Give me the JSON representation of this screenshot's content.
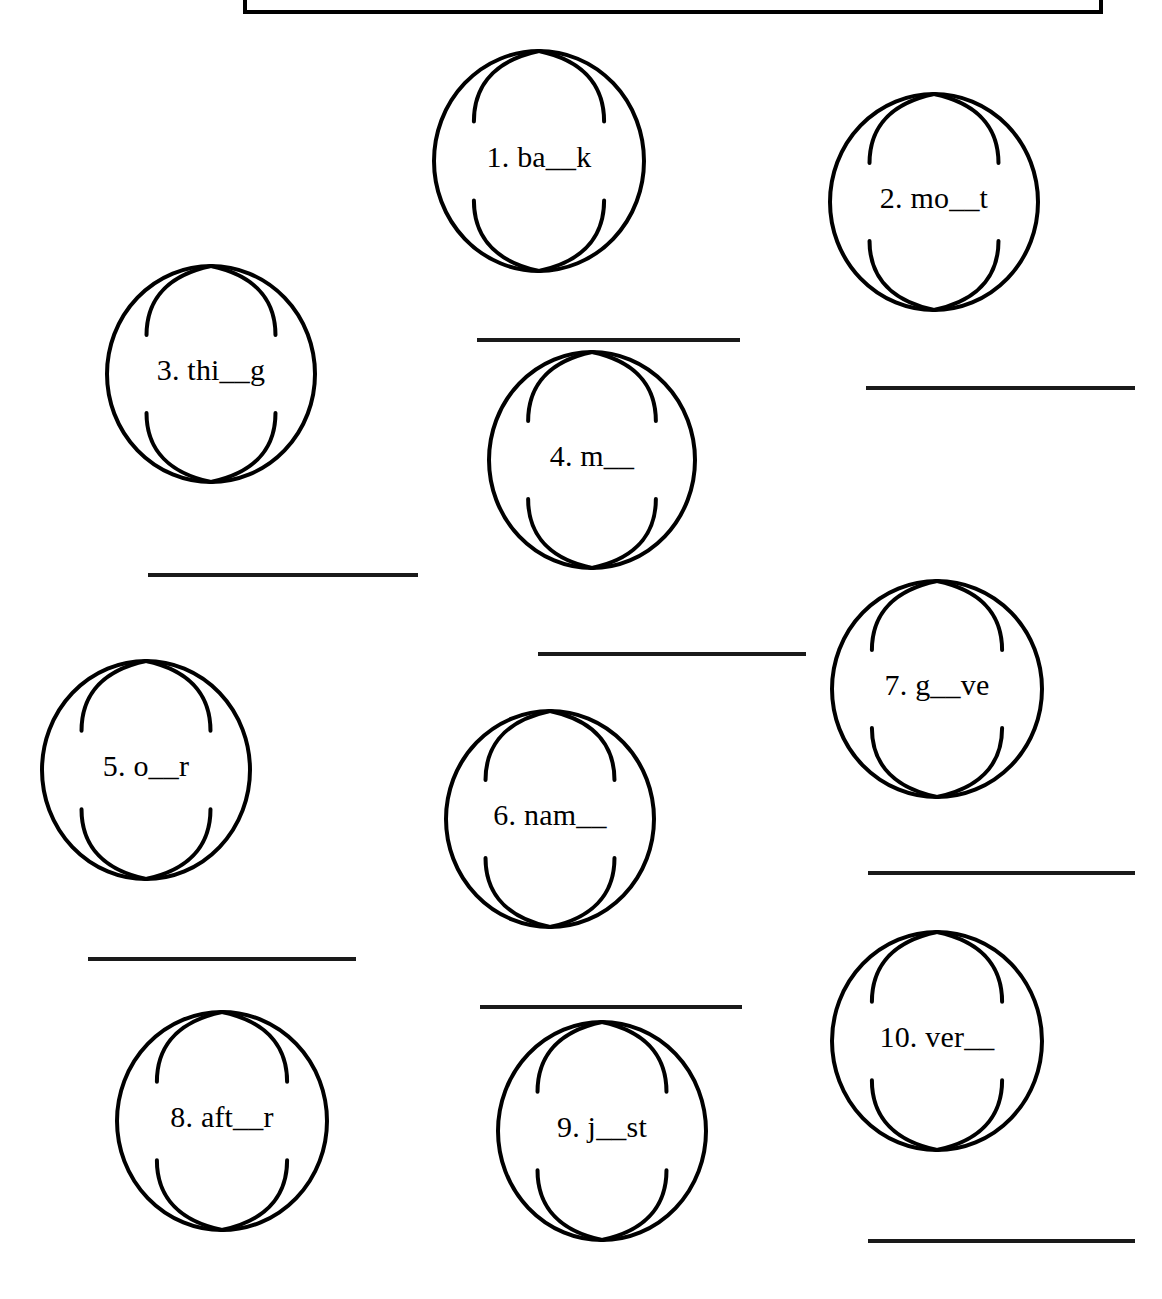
{
  "page": {
    "kind": "worksheet",
    "width": 1162,
    "height": 1299,
    "background_color": "#ffffff",
    "ink_color": "#000000",
    "title_box": {
      "text": "",
      "border_color": "#000000",
      "visible_portion": "bottom-border-only"
    }
  },
  "items": [
    {
      "number": "1.",
      "label": "1. ba__k",
      "word_fragment": "ba__k",
      "shape": "globe",
      "circle": {
        "cx": 539,
        "cy": 161,
        "rx": 105,
        "ry": 110
      },
      "label_pos": {
        "x": 434,
        "y": 148
      },
      "answer_line": {
        "x": 477,
        "y": 338,
        "width": 263
      }
    },
    {
      "number": "2.",
      "label": "2. mo__t",
      "word_fragment": "mo__t",
      "shape": "globe",
      "circle": {
        "cx": 934,
        "cy": 202,
        "rx": 104,
        "ry": 108
      },
      "label_pos": {
        "x": 830,
        "y": 189
      },
      "answer_line": {
        "x": 866,
        "y": 386,
        "width": 269
      }
    },
    {
      "number": "3.",
      "label": "3. thi__g",
      "word_fragment": "thi__g",
      "shape": "globe",
      "circle": {
        "cx": 211,
        "cy": 374,
        "rx": 104,
        "ry": 108
      },
      "label_pos": {
        "x": 107,
        "y": 361
      },
      "answer_line": {
        "x": 148,
        "y": 573,
        "width": 270
      }
    },
    {
      "number": "4.",
      "label": "4. m__",
      "word_fragment": "m__",
      "shape": "globe",
      "circle": {
        "cx": 592,
        "cy": 460,
        "rx": 103,
        "ry": 108
      },
      "label_pos": {
        "x": 489,
        "y": 447
      },
      "answer_line": {
        "x": 538,
        "y": 652,
        "width": 268
      }
    },
    {
      "number": "5.",
      "label": "5. o__r",
      "word_fragment": "o__r",
      "shape": "globe",
      "circle": {
        "cx": 146,
        "cy": 770,
        "rx": 104,
        "ry": 109
      },
      "label_pos": {
        "x": 42,
        "y": 757
      },
      "answer_line": {
        "x": 88,
        "y": 957,
        "width": 268
      }
    },
    {
      "number": "6.",
      "label": "6. nam__",
      "word_fragment": "nam__",
      "shape": "globe",
      "circle": {
        "cx": 550,
        "cy": 819,
        "rx": 104,
        "ry": 108
      },
      "label_pos": {
        "x": 446,
        "y": 806
      },
      "answer_line": {
        "x": 480,
        "y": 1005,
        "width": 262
      }
    },
    {
      "number": "7.",
      "label": "7. g__ve",
      "word_fragment": "g__ve",
      "shape": "globe",
      "circle": {
        "cx": 937,
        "cy": 689,
        "rx": 105,
        "ry": 108
      },
      "label_pos": {
        "x": 832,
        "y": 676
      },
      "answer_line": {
        "x": 868,
        "y": 871,
        "width": 267
      }
    },
    {
      "number": "8.",
      "label": "8. aft__r",
      "word_fragment": "aft__r",
      "shape": "globe",
      "circle": {
        "cx": 222,
        "cy": 1121,
        "rx": 105,
        "ry": 109
      },
      "label_pos": {
        "x": 117,
        "y": 1108
      },
      "answer_line": null
    },
    {
      "number": "9.",
      "label": "9. j__st",
      "word_fragment": "j__st",
      "shape": "globe",
      "circle": {
        "cx": 602,
        "cy": 1131,
        "rx": 104,
        "ry": 109
      },
      "label_pos": {
        "x": 498,
        "y": 1118
      },
      "answer_line": null
    },
    {
      "number": "10.",
      "label": "10. ver__",
      "word_fragment": "ver__",
      "shape": "globe",
      "circle": {
        "cx": 937,
        "cy": 1041,
        "rx": 105,
        "ry": 109
      },
      "label_pos": {
        "x": 832,
        "y": 1028
      },
      "answer_line": {
        "x": 868,
        "y": 1239,
        "width": 267
      }
    }
  ]
}
